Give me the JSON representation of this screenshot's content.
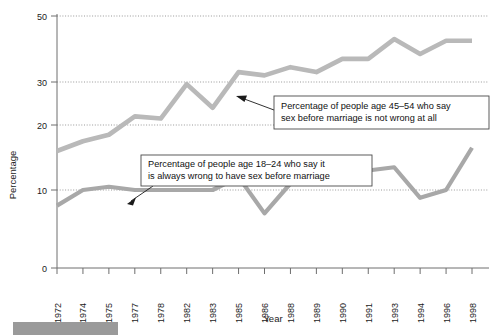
{
  "chart_data": {
    "type": "line",
    "title": "",
    "xlabel": "Year",
    "ylabel": "Percentage",
    "grid": true,
    "legend_position": "annotations",
    "xlim": [
      0,
      16
    ],
    "ylim": [
      0,
      50
    ],
    "ytick_labels": [
      "0",
      "10",
      "20",
      "30",
      "50"
    ],
    "ytick_values": [
      0,
      10,
      20,
      30,
      50
    ],
    "categories": [
      "1972",
      "1974",
      "1975",
      "1977",
      "1978",
      "1982",
      "1983",
      "1985",
      "1986",
      "1988",
      "1989",
      "1990",
      "1991",
      "1993",
      "1994",
      "1996",
      "1998"
    ],
    "series": [
      {
        "name": "Percentage of people age 45-54 who say sex before marriage is not wrong at all",
        "color": "#b9b9b9",
        "values": [
          16,
          17.5,
          18.5,
          22,
          21.5,
          29.5,
          24,
          33,
          32,
          34.5,
          33,
          37,
          37,
          43,
          38.5,
          42.5,
          42.5
        ]
      },
      {
        "name": "Percentage of people age 18-24 who say it is always wrong to have sex before marriage",
        "color": "#a8a8a8",
        "values": [
          8,
          10,
          10.5,
          10,
          10,
          10,
          10,
          12,
          7,
          11,
          11.5,
          12,
          13,
          13.5,
          9,
          10,
          16.5
        ]
      }
    ],
    "annotations": [
      {
        "id": "annotation-45-54",
        "line1": "Percentage of people age 45–54 who say",
        "line2": "sex before marriage is not wrong at all"
      },
      {
        "id": "annotation-18-24",
        "line1": "Percentage of people age 18–24 who say it",
        "line2": "is always wrong to have sex before marriage"
      }
    ]
  },
  "colors": {
    "series_upper": "#b9b9b9",
    "series_lower": "#a8a8a8",
    "grid": "#8d8d8d",
    "axis": "#6e6e6e",
    "text": "#1b1b1b",
    "banner": "#9a9a9a"
  }
}
